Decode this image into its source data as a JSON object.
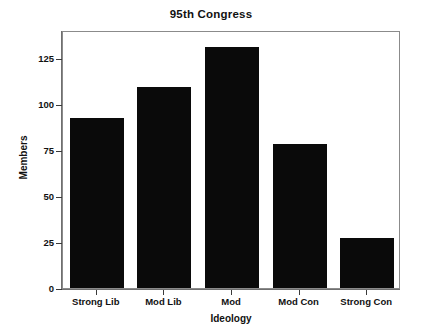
{
  "chart_data": {
    "type": "bar",
    "title": "95th Congress",
    "xlabel": "Ideology",
    "ylabel": "Members",
    "categories": [
      "Strong Lib",
      "Mod Lib",
      "Mod",
      "Mod Con",
      "Strong Con"
    ],
    "values": [
      92,
      109,
      131,
      78,
      27
    ],
    "ylim": [
      0,
      140
    ],
    "yticks": [
      0,
      25,
      50,
      75,
      100,
      125
    ],
    "ytick_labels": [
      "0",
      "25",
      "50",
      "75",
      "100",
      "125"
    ],
    "grid": false,
    "legend": null,
    "bar_color": "#0a0a0a",
    "frame_color": "#8b8b8b",
    "background": "#ffffff"
  }
}
